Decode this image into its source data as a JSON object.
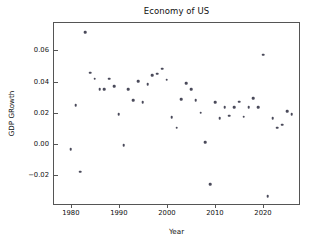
{
  "chart_data": {
    "type": "scatter",
    "title": "Economy of US",
    "xlabel": "Year",
    "ylabel": "GDP GRowth",
    "xlim": [
      1976.5,
      2027.5
    ],
    "ylim": [
      -0.0385,
      0.0775
    ],
    "grid": false,
    "legend": null,
    "xticks": [
      1980,
      1990,
      2000,
      2010,
      2020
    ],
    "xticklabels": [
      "1980",
      "1990",
      "2000",
      "2010",
      "2020"
    ],
    "yticks": [
      -0.02,
      0.0,
      0.02,
      0.04,
      0.06
    ],
    "yticklabels": [
      "−0.02",
      "0.00",
      "0.02",
      "0.04",
      "0.06"
    ],
    "marker": {
      "shape": "circle",
      "color": "#4a4a5a",
      "size_px": 2.6
    },
    "x": [
      1980,
      1981,
      1982,
      1983,
      1984,
      1985,
      1986,
      1987,
      1988,
      1989,
      1990,
      1991,
      1992,
      1993,
      1994,
      1995,
      1996,
      1997,
      1998,
      1999,
      2000,
      2001,
      2002,
      2003,
      2004,
      2005,
      2006,
      2007,
      2008,
      2009,
      2010,
      2011,
      2012,
      2013,
      2014,
      2015,
      2016,
      2017,
      2018,
      2019,
      2020,
      2021,
      2022,
      2023,
      2024,
      2025,
      2026
    ],
    "y": [
      -0.0033,
      0.0249,
      -0.0177,
      0.0715,
      0.0456,
      0.0418,
      0.0352,
      0.0352,
      0.0418,
      0.0369,
      0.0191,
      -0.0008,
      0.0352,
      0.0281,
      0.0402,
      0.0268,
      0.0381,
      0.0441,
      0.0449,
      0.0481,
      0.0411,
      0.0173,
      0.0104,
      0.0288,
      0.0389,
      0.0351,
      0.0281,
      0.0201,
      0.0011,
      -0.0258,
      0.0268,
      0.0164,
      0.0235,
      0.0182,
      0.0235,
      0.0271,
      0.0174,
      0.0235,
      0.0294,
      0.0234,
      0.0573,
      -0.0334,
      0.0163,
      0.0105,
      0.0122,
      0.0211,
      0.0192
    ]
  }
}
